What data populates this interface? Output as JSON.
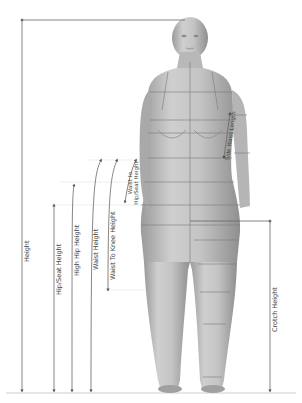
{
  "diagram": {
    "title": "",
    "colors": {
      "line": "#6b6b6b",
      "body": "#b9b9b9",
      "body_shadow": "#8e8e8e",
      "grid": "#7a7a7a",
      "ground": "#cfcfcf"
    },
    "measurements": [
      {
        "id": "height",
        "label": "Height"
      },
      {
        "id": "hip-seat-height",
        "label": "Hip/Seat Height"
      },
      {
        "id": "high-hip-height",
        "label": "High Hip Height"
      },
      {
        "id": "waist-height",
        "label": "Waist Height"
      },
      {
        "id": "waist-to-knee-height",
        "label": "Waist To Knee Height"
      },
      {
        "id": "waist-to-hip-seat-height",
        "label": "Waist to Hip/Seat Height"
      },
      {
        "id": "side-waist-length",
        "label": "Side Waist Length"
      },
      {
        "id": "crotch-height",
        "label": "Crotch Height"
      }
    ]
  }
}
